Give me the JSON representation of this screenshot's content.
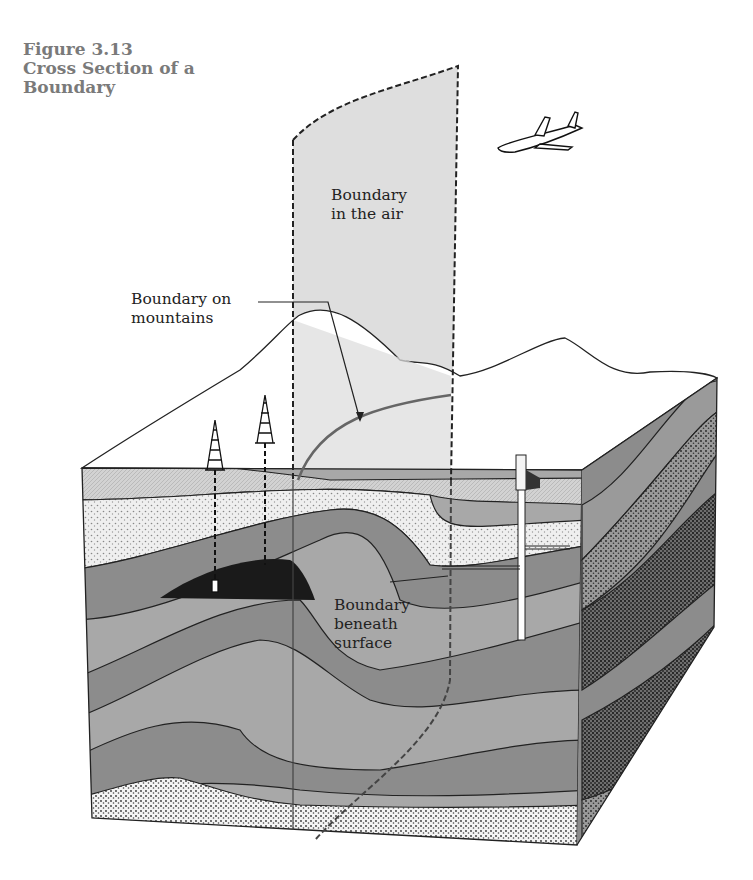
{
  "figure": {
    "number": "Figure 3.13",
    "title_line1": "Cross Section of a",
    "title_line2": "Boundary"
  },
  "labels": {
    "air_line1": "Boundary",
    "air_line2": "in the air",
    "mountains_line1": "Boundary on",
    "mountains_line2": "mountains",
    "beneath_line1": "Boundary",
    "beneath_line2": "beneath",
    "beneath_line3": "surface"
  },
  "colors": {
    "caption": "#7a7a7a",
    "boundary_plane": "#d9d9d9",
    "layer_dark": "#8c8c8c",
    "layer_mid": "#a8a8a8",
    "layer_light_dotted": "#e6e6e6",
    "oil_pool": "#1a1a1a",
    "outline": "#222222"
  }
}
